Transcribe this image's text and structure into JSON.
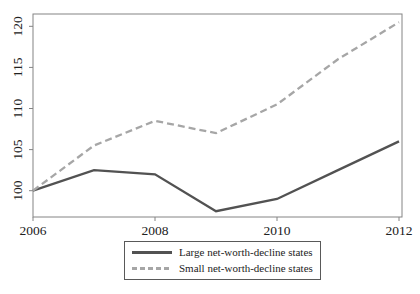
{
  "chart_data": {
    "type": "line",
    "title": "",
    "xlabel": "",
    "ylabel": "",
    "x": [
      2006,
      2007,
      2008,
      2009,
      2010,
      2011,
      2012
    ],
    "series": [
      {
        "name": "Large net-worth-decline states",
        "values": [
          100,
          102.5,
          102,
          97.5,
          99,
          102.5,
          106
        ],
        "dash": "solid",
        "color": "#525252"
      },
      {
        "name": "Small net-worth-decline states",
        "values": [
          100,
          105.5,
          108.5,
          107,
          110.5,
          116,
          120.5
        ],
        "dash": "dashed",
        "color": "#a6a6a6"
      }
    ],
    "x_ticks": [
      2006,
      2008,
      2010,
      2012
    ],
    "y_ticks": [
      100,
      105,
      110,
      115,
      120
    ],
    "xlim": [
      2006,
      2012
    ],
    "ylim": [
      96.8,
      121.5
    ],
    "grid": false,
    "legend_position": "bottom-center",
    "frame_color": "#848484",
    "text_color": "#212121",
    "background_color": "#ffffff",
    "legend_border_color": "#595959"
  }
}
